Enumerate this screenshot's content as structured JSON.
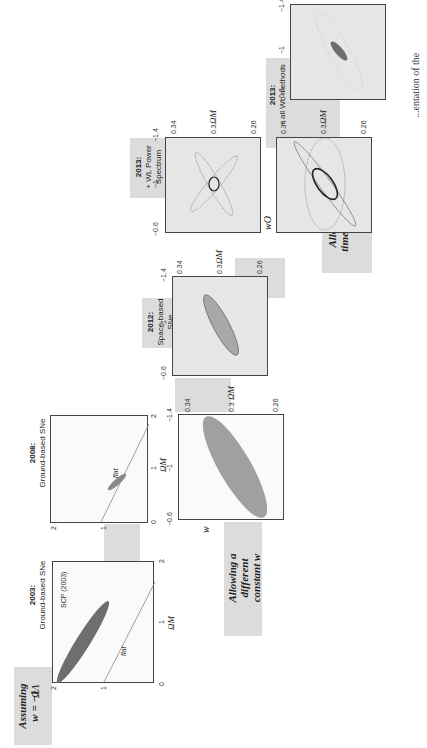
{
  "figure": {
    "orientation": "rotated 90 degrees counter-clockwise",
    "caption_fragment": "...entation of the"
  },
  "rows": {
    "top_labels": {
      "assuming": "Assuming w = −1",
      "assuming_line1": "Assuming",
      "assuming_line2": "w = −1",
      "constant_line1": "Allowing a",
      "constant_line2": "different",
      "constant_line3": "constant w",
      "time_line1": "Allowing a",
      "time_line2": "time-varying",
      "time_line3": "w"
    }
  },
  "panels": [
    {
      "id": "2003",
      "year": "2003:",
      "subtitle": "Ground-based SNe",
      "annotation": "SCP (2003)",
      "flat_label": "flat",
      "xlabel": "ΩM",
      "ylabel": "ΩΛ",
      "xticks": [
        "0",
        "1",
        "2"
      ],
      "yticks": [
        "1",
        "2"
      ]
    },
    {
      "id": "2008",
      "year": "2008:",
      "subtitle": "Ground-based SNe",
      "flat_label": "flat",
      "xlabel": "ΩM",
      "xticks": [
        "0",
        "1",
        "2"
      ],
      "yticks": [
        "0",
        "1",
        "2"
      ]
    },
    {
      "id": "2008w",
      "xlabel": "ΩM",
      "ylabel": "w",
      "xticks": [
        "0.26",
        "0.3",
        "0.34"
      ],
      "yticks": [
        "−0.6",
        "−1",
        "−1.4"
      ]
    },
    {
      "id": "2012",
      "year": "2012:",
      "subtitle": "Space-based SNe",
      "xlabel": "ΩM",
      "xticks": [
        "0.26",
        "0.3",
        "0.34"
      ],
      "yticks": [
        "−0.6",
        "−1",
        "−1.4"
      ]
    },
    {
      "id": "2013ps",
      "year": "2013:",
      "subtitle": "+ WL Power Spectrum",
      "xlabel": "ΩM",
      "xticks": [
        "0.26",
        "0.3",
        "0.34"
      ],
      "yticks": [
        "−0.6",
        "−1",
        "−1.4"
      ]
    },
    {
      "id": "2013ps_wo",
      "xlabel": "ΩM",
      "ylabel": "wO",
      "xticks": [
        "0.26",
        "0.3",
        "0.34"
      ],
      "yticks": [
        "−0.6",
        "−1",
        "−1.4"
      ]
    },
    {
      "id": "2013all",
      "year": "2013:",
      "subtitle": "+ all WL methods",
      "xlabel": "ΩM",
      "xticks": [
        "0.26",
        "0.3",
        "0.34"
      ],
      "yticks": [
        "−0.6",
        "−1",
        "−1.4"
      ]
    },
    {
      "id": "2013all_wo",
      "xlabel": "ΩM",
      "xticks": [
        "0.26",
        "0.3",
        "0.34"
      ],
      "yticks": [
        "−0.6",
        "−1",
        "−1.4"
      ]
    }
  ],
  "colors": {
    "band": "#dcdcdc",
    "ellipse_dark": "#6e6e6e",
    "ellipse_mid": "#a0a0a0",
    "frame": "#444444"
  }
}
